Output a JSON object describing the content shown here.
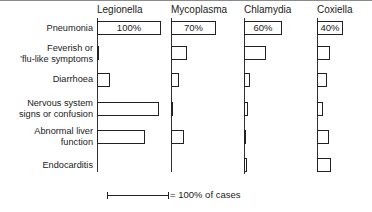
{
  "chart_data": {
    "type": "bar",
    "orientation": "horizontal",
    "layout": "small-multiples",
    "title": "",
    "categories": [
      "Pneumonia",
      "Feverish or 'flu-like symptoms",
      "Diarrhoea",
      "Nervous system signs or confusion",
      "Abnormal liver function",
      "Endocarditis"
    ],
    "series": [
      {
        "name": "Legionella",
        "values": [
          100,
          3,
          20,
          97,
          75,
          0
        ],
        "label": "100%"
      },
      {
        "name": "Mycoplasma",
        "values": [
          70,
          25,
          12,
          3,
          20,
          0
        ],
        "label": "70%"
      },
      {
        "name": "Chlamydia",
        "values": [
          60,
          35,
          10,
          6,
          1,
          5
        ],
        "label": "60%"
      },
      {
        "name": "Coxiella",
        "values": [
          40,
          20,
          15,
          10,
          18,
          22
        ],
        "label": "40%"
      }
    ],
    "xlabel": "",
    "ylabel": "",
    "xlim": [
      0,
      100
    ],
    "grid": false,
    "legend": "scale bar = 100% of cases",
    "scale_label": "= 100% of cases",
    "unit": "% of cases"
  }
}
